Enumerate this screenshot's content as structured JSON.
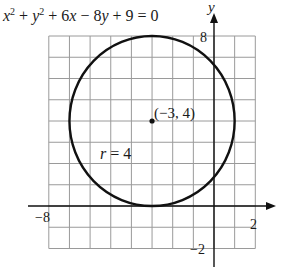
{
  "chart_data": {
    "type": "scatter",
    "xlabel": "",
    "ylabel": "y",
    "xlim": [
      -8,
      2
    ],
    "ylim": [
      -2,
      8
    ],
    "grid": true,
    "grid_step": 1,
    "tick_labels": {
      "x": [
        {
          "value": -8,
          "label": "−8"
        },
        {
          "value": 2,
          "label": "2"
        }
      ],
      "y": [
        {
          "value": 8,
          "label": "8"
        },
        {
          "value": -2,
          "label": "−2"
        }
      ]
    },
    "shapes": [
      {
        "kind": "circle",
        "center": [
          -3,
          4
        ],
        "radius": 4
      }
    ],
    "points": [
      {
        "x": -3,
        "y": 4,
        "label": "(−3, 4)"
      }
    ],
    "annotations": [
      {
        "text": "r = 4",
        "x": -5.5,
        "y": 1.7
      }
    ]
  },
  "labels": {
    "equation": {
      "x": "x",
      "sq": "2",
      "plus1": " + ",
      "y": "y",
      "plus2": " + 6",
      "x2": "x",
      "minus": " − 8",
      "y2": "y",
      "rest": " + 9 = 0"
    },
    "y_axis_name": "y",
    "x_tick_min": "−8",
    "x_tick_max": "2",
    "y_tick_max": "8",
    "y_tick_min": "−2",
    "center_label": "(−3, 4)",
    "radius_label_r": "r",
    "radius_label_rest": " = 4"
  },
  "colors": {
    "grid": "#9a9a9a",
    "axis": "#111111",
    "circle": "#111111",
    "text": "#1a1a1a",
    "background": "#ffffff"
  }
}
